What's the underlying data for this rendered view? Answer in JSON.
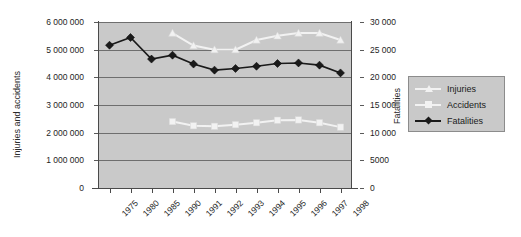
{
  "chart_data": {
    "type": "line",
    "title": "",
    "categories": [
      "1975",
      "1980",
      "1985",
      "1990",
      "1991",
      "1992",
      "1993",
      "1994",
      "1995",
      "1996",
      "1997",
      "1998"
    ],
    "series": [
      {
        "name": "Injuries",
        "axis": "left",
        "color": "#f2f2f2",
        "marker": "triangle",
        "values": [
          null,
          null,
          null,
          5600000,
          5150000,
          5000000,
          5000000,
          5350000,
          5500000,
          5600000,
          5600000,
          5350000
        ]
      },
      {
        "name": "Accidents",
        "axis": "left",
        "color": "#f2f2f2",
        "marker": "square",
        "values": [
          null,
          null,
          null,
          2400000,
          2250000,
          2230000,
          2290000,
          2360000,
          2450000,
          2460000,
          2360000,
          2200000
        ]
      },
      {
        "name": "Fatalities",
        "axis": "right",
        "color": "#1a1a1a",
        "marker": "diamond",
        "values": [
          25800,
          27200,
          23300,
          24000,
          22400,
          21300,
          21600,
          22000,
          22500,
          22600,
          22200,
          20800
        ]
      }
    ],
    "xlabel": "",
    "ylabel_left": "Injuries and accidents",
    "ylabel_right": "Fatalities",
    "ylim_left": [
      0,
      6000000
    ],
    "ylim_right": [
      0,
      30000
    ],
    "yticks_left": [
      "0",
      "1 000 000",
      "2 000 000",
      "3 000 000",
      "4 000 000",
      "5 000 000",
      "6 000 000"
    ],
    "yticks_left_values": [
      0,
      1000000,
      2000000,
      3000000,
      4000000,
      5000000,
      6000000
    ],
    "yticks_right": [
      "0",
      "5000",
      "10 000",
      "15 000",
      "20 000",
      "25 000",
      "30 000"
    ],
    "yticks_right_values": [
      0,
      5000,
      10000,
      15000,
      20000,
      25000,
      30000
    ],
    "grid": true,
    "legend_position": "right",
    "plot_background": "#c9c9c9",
    "gridline_color": "#6e6e6e"
  },
  "legend": {
    "items": [
      {
        "label": "Injuries"
      },
      {
        "label": "Accidents"
      },
      {
        "label": "Fatalities"
      }
    ]
  }
}
